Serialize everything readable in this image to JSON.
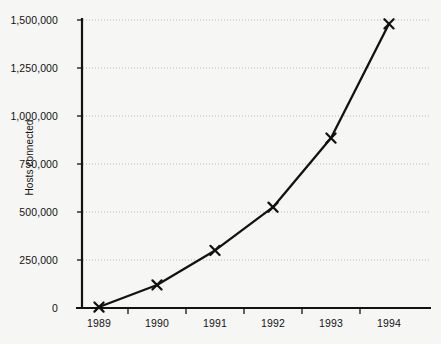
{
  "chart_data": {
    "type": "line",
    "title": "",
    "subtitle": "",
    "xlabel": "",
    "ylabel": "Hosts connected",
    "categories": [
      "1989",
      "1990",
      "1991",
      "1992",
      "1993",
      "1994"
    ],
    "x": [
      1989,
      1990,
      1991,
      1992,
      1993,
      1994
    ],
    "values": [
      5000,
      120000,
      300000,
      525000,
      885000,
      1480000
    ],
    "series": [
      {
        "name": "Hosts connected",
        "values": [
          5000,
          120000,
          300000,
          525000,
          885000,
          1480000
        ]
      }
    ],
    "ylim": [
      0,
      1500000
    ],
    "y_ticks": [
      0,
      250000,
      500000,
      750000,
      1000000,
      1250000,
      1500000
    ],
    "y_tick_labels": [
      "0",
      "250,000",
      "500,000",
      "750,000",
      "1,000,000",
      "1,250,000",
      "1,500,000"
    ],
    "x_tick_labels": [
      "1989",
      "1990",
      "1991",
      "1992",
      "1993",
      "1994"
    ],
    "grid": true,
    "grid_axis": "y",
    "grid_style": "dotted",
    "legend": false,
    "legend_position": "none",
    "marker": "x",
    "line_color": "#121212",
    "grid_color": "#b8b8b8",
    "axis_color": "#121212",
    "background_color": "#f6f6f4",
    "text_color": "#131313"
  },
  "axis": {
    "y_title": "Hosts connected"
  }
}
